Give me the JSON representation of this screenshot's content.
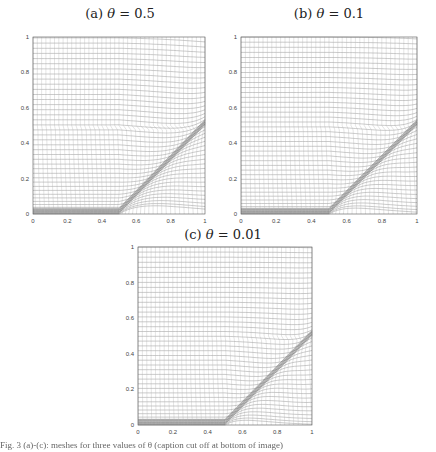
{
  "figure": {
    "caption_partial": "Fig. 3 (a)-(c): meshes for three values of θ (caption cut off at bottom of image)"
  },
  "chart_data": [
    {
      "type": "mesh",
      "id": "a",
      "title": "(a) θ = 0.5",
      "title_prefix": "(a)",
      "theta": 0.5,
      "xlim": [
        0,
        1
      ],
      "ylim": [
        0,
        1
      ],
      "xticks": [
        "0",
        "0.2",
        "0.4",
        "0.6",
        "0.8",
        "1"
      ],
      "yticks": [
        "0",
        "0.2",
        "0.4",
        "0.6",
        "0.8",
        "1"
      ],
      "features": "Adaptive moving mesh; mesh lines concentrate along bottom boundary y≈0 for x<0.5 and along a diagonal layer from (0.5,0) to (1,0.5)",
      "layer_start": [
        0.5,
        0.0
      ],
      "layer_end": [
        1.0,
        0.5
      ],
      "grid_lines": 40
    },
    {
      "type": "mesh",
      "id": "b",
      "title": "(b) θ = 0.1",
      "title_prefix": "(b)",
      "theta": 0.1,
      "xlim": [
        0,
        1
      ],
      "ylim": [
        0,
        1
      ],
      "xticks": [
        "0",
        "0.2",
        "0.4",
        "0.6",
        "0.8",
        "1"
      ],
      "yticks": [
        "0",
        "0.2",
        "0.4",
        "0.6",
        "0.8",
        "1"
      ],
      "features": "Adaptive moving mesh with stronger concentration along diagonal layer from (0.5,0) to (1,0.5) and bottom boundary",
      "layer_start": [
        0.5,
        0.0
      ],
      "layer_end": [
        1.0,
        0.5
      ],
      "grid_lines": 40
    },
    {
      "type": "mesh",
      "id": "c",
      "title": "(c) θ = 0.01",
      "title_prefix": "(c)",
      "theta": 0.01,
      "xlim": [
        0,
        1
      ],
      "ylim": [
        0,
        1
      ],
      "xticks": [
        "0",
        "0.2",
        "0.4",
        "0.6",
        "0.8",
        "1"
      ],
      "yticks": [
        "0",
        "0.2",
        "0.4",
        "0.6",
        "0.8",
        "1"
      ],
      "features": "Adaptive moving mesh; mesh lines concentrate along diagonal layer from (0.5,0) to (1,0.5) and bottom boundary for x<0.5",
      "layer_start": [
        0.5,
        0.0
      ],
      "layer_end": [
        1.0,
        0.5
      ],
      "grid_lines": 40
    }
  ],
  "panels": {
    "a": {
      "label": "(a) ",
      "theta_sym": "θ",
      "eq": " = 0.5"
    },
    "b": {
      "label": "(b) ",
      "theta_sym": "θ",
      "eq": " = 0.1"
    },
    "c": {
      "label": "(c) ",
      "theta_sym": "θ",
      "eq": " = 0.01"
    }
  },
  "colors": {
    "mesh_line": "#8a8a8a",
    "axis": "#555555",
    "background": "#ffffff"
  }
}
